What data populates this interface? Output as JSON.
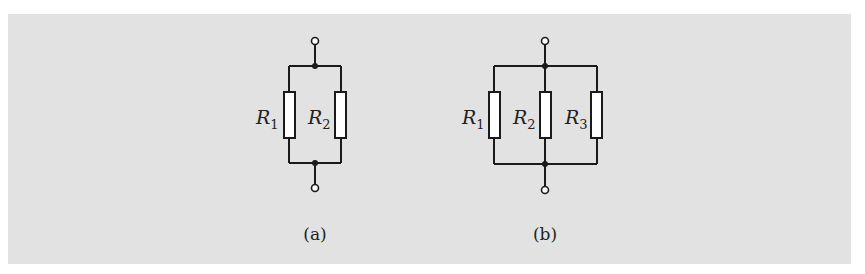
{
  "figure": {
    "background_color": "#e2e2e2",
    "line_color": "#1a1a1a",
    "resistor_fill": "#ffffff"
  },
  "circuit_a": {
    "caption": "(a)",
    "resistors": [
      {
        "symbol": "R",
        "subscript": "1"
      },
      {
        "symbol": "R",
        "subscript": "2"
      }
    ]
  },
  "circuit_b": {
    "caption": "(b)",
    "resistors": [
      {
        "symbol": "R",
        "subscript": "1"
      },
      {
        "symbol": "R",
        "subscript": "2"
      },
      {
        "symbol": "R",
        "subscript": "3"
      }
    ]
  }
}
